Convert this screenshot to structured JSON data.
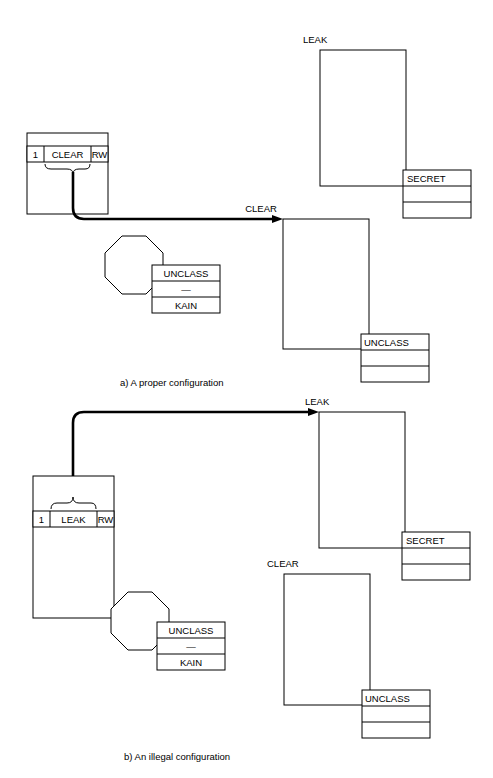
{
  "figure": {
    "panels": [
      {
        "id": "panel-a",
        "caption": "a)  A proper configuration",
        "subject": {
          "capability_index": "1",
          "capability_name": "CLEAR",
          "capability_rights": "RW"
        },
        "subject_label_table": {
          "level": "UNCLASS",
          "separator": "—",
          "compartment": "KAIN"
        },
        "objects": [
          {
            "id": "object-leak",
            "name": "LEAK",
            "label_table": {
              "level": "SECRET",
              "row2": "",
              "row3": ""
            }
          },
          {
            "id": "object-clear",
            "name": "CLEAR",
            "label_table": {
              "level": "UNCLASS",
              "row2": "",
              "row3": ""
            }
          }
        ],
        "flow_target": "CLEAR"
      },
      {
        "id": "panel-b",
        "caption": "b)  An illegal configuration",
        "subject": {
          "capability_index": "1",
          "capability_name": "LEAK",
          "capability_rights": "RW"
        },
        "subject_label_table": {
          "level": "UNCLASS",
          "separator": "—",
          "compartment": "KAIN"
        },
        "objects": [
          {
            "id": "object-leak",
            "name": "LEAK",
            "label_table": {
              "level": "SECRET",
              "row2": "",
              "row3": ""
            }
          },
          {
            "id": "object-clear",
            "name": "CLEAR",
            "label_table": {
              "level": "UNCLASS",
              "row2": "",
              "row3": ""
            }
          }
        ],
        "flow_target": "LEAK"
      }
    ],
    "colors": {
      "ink": "#000000",
      "paper": "#ffffff"
    }
  }
}
